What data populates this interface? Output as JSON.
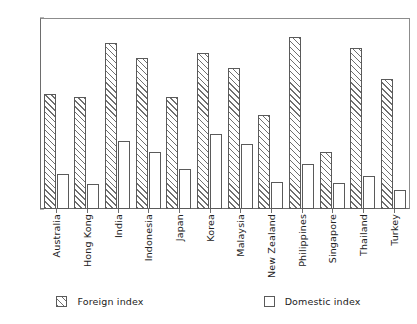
{
  "chart_data": {
    "type": "bar",
    "title": "",
    "subtitle": "",
    "xlabel": "",
    "ylabel": "",
    "ylim": [
      0,
      0.7
    ],
    "ytick_labels": [
      "0.7",
      "0.6",
      "0.5",
      "0.4",
      "0.3",
      "0.2",
      "0.1",
      "0"
    ],
    "ytick_values": [
      0.7,
      0.6,
      0.5,
      0.4,
      0.3,
      0.2,
      0.1,
      0
    ],
    "grid": false,
    "legend_position": "bottom",
    "categories": [
      "Australia",
      "Hong Kong",
      "India",
      "Indonesia",
      "Japan",
      "Korea",
      "Malaysia",
      "New Zealand",
      "Philippines",
      "Singapore",
      "Thailand",
      "Turkey"
    ],
    "series": [
      {
        "name": "Foreign index",
        "pattern": "diagonal-hatch",
        "values": [
          0.42,
          0.41,
          0.61,
          0.555,
          0.41,
          0.57,
          0.515,
          0.345,
          0.63,
          0.21,
          0.59,
          0.475
        ]
      },
      {
        "name": "Domestic index",
        "pattern": "open",
        "values": [
          0.13,
          0.09,
          0.25,
          0.21,
          0.145,
          0.275,
          0.24,
          0.1,
          0.165,
          0.095,
          0.12,
          0.07
        ]
      }
    ]
  },
  "colors": {
    "axis": "#6d6d6d",
    "bar_outline": "#5a5a5a",
    "hatch": "#6f6f6f",
    "background": "#ffffff",
    "text": "#222222"
  }
}
